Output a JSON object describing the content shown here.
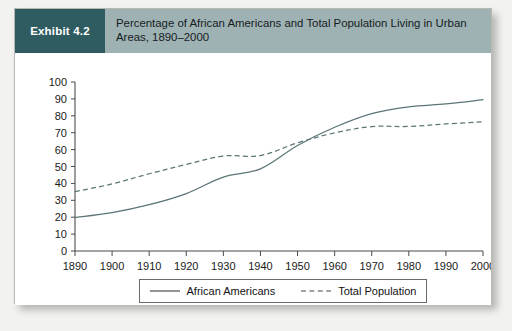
{
  "exhibit": {
    "tag": "Exhibit 4.2",
    "title": "Percentage of African Americans and Total Population Living in Urban Areas, 1890–2000",
    "tag_bg": "#2e5c60",
    "header_bg": "#9fb2b3",
    "line_color": "#5c7577"
  },
  "chart_data": {
    "type": "line",
    "title": "Percentage of African Americans and Total Population Living in Urban Areas, 1890–2000",
    "xlabel": "",
    "ylabel": "",
    "x": [
      1890,
      1900,
      1910,
      1920,
      1930,
      1940,
      1950,
      1960,
      1970,
      1980,
      1990,
      2000
    ],
    "xtick_labels": [
      "1890",
      "1900",
      "1910",
      "1920",
      "1930",
      "1940",
      "1950",
      "1960",
      "1970",
      "1980",
      "1990",
      "2000"
    ],
    "ytick_labels": [
      "0",
      "10",
      "20",
      "30",
      "40",
      "50",
      "60",
      "70",
      "80",
      "90",
      "100"
    ],
    "ylim": [
      0,
      100
    ],
    "xlim": [
      1890,
      2000
    ],
    "grid": false,
    "legend_position": "bottom",
    "series": [
      {
        "name": "African Americans",
        "style": "solid",
        "color": "#5c7577",
        "values": [
          19.8,
          22.7,
          27.4,
          34.0,
          43.7,
          48.6,
          62.4,
          73.2,
          81.3,
          85.3,
          87.0,
          89.5
        ]
      },
      {
        "name": "Total Population",
        "style": "dashed",
        "color": "#5c7577",
        "values": [
          35.1,
          39.7,
          45.7,
          51.2,
          56.2,
          56.5,
          64.0,
          69.9,
          73.6,
          73.7,
          75.2,
          76.4
        ]
      }
    ]
  }
}
